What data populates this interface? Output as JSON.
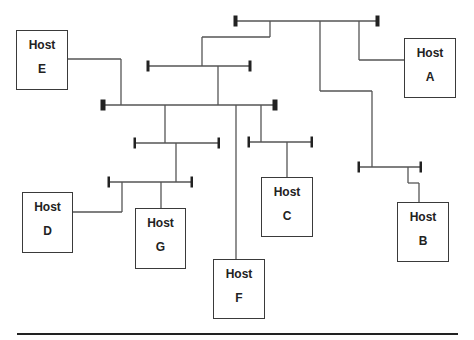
{
  "diagram": {
    "title": "",
    "hosts": [
      {
        "id": "A",
        "line1": "Host",
        "line2": "A"
      },
      {
        "id": "B",
        "line1": "Host",
        "line2": "B"
      },
      {
        "id": "C",
        "line1": "Host",
        "line2": "C"
      },
      {
        "id": "D",
        "line1": "Host",
        "line2": "D"
      },
      {
        "id": "E",
        "line1": "Host",
        "line2": "E"
      },
      {
        "id": "F",
        "line1": "Host",
        "line2": "F"
      },
      {
        "id": "G",
        "line1": "Host",
        "line2": "G"
      }
    ]
  }
}
